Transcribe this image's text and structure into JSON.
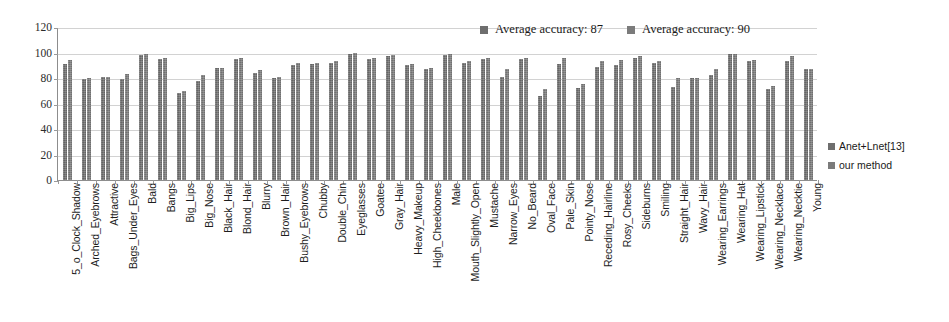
{
  "chart_data": {
    "type": "bar",
    "title": "",
    "xlabel": "",
    "ylabel": "",
    "ylim": [
      0,
      120
    ],
    "ytick_step": 20,
    "yticks": [
      120,
      100,
      80,
      60,
      40,
      20,
      0
    ],
    "grid": true,
    "legend_position": "top-center and right",
    "categories": [
      "5_o_Clock_Shadow",
      "Arched_Eyebrows",
      "Attractive",
      "Bags_Under_Eyes",
      "Bald",
      "Bangs",
      "Big_Lips",
      "Big_Nose",
      "Black_Hair",
      "Blond_Hair",
      "Blurry",
      "Brown_Hair",
      "Bushy_Eyebrows",
      "Chubby",
      "Double_Chin",
      "Eyeglasses",
      "Goatee",
      "Gray_Hair",
      "Heavy_Makeup",
      "High_Cheekbones",
      "Male",
      "Mouth_Slightly_Open",
      "Mustache",
      "Narrow_Eyes",
      "No_Beard",
      "Oval_Face",
      "Pale_Skin",
      "Pointy_Nose",
      "Receding_Hairline",
      "Rosy_Cheeks",
      "Sideburns",
      "Smiling",
      "Straight_Hair",
      "Wavy_Hair",
      "Wearing_Earrings",
      "Wearing_Hat",
      "Wearing_Lipstick",
      "Wearing_Necklace",
      "Wearing_Necktie",
      "Young"
    ],
    "series": [
      {
        "name": "Anet+Lnet[13]",
        "color": "#6e6e6e",
        "values": [
          91,
          79,
          81,
          79,
          98,
          95,
          68,
          78,
          88,
          95,
          84,
          80,
          90,
          91,
          92,
          99,
          95,
          97,
          90,
          87,
          98,
          92,
          95,
          81,
          95,
          66,
          91,
          72,
          89,
          90,
          96,
          92,
          73,
          80,
          82,
          99,
          93,
          71,
          93,
          87
        ]
      },
      {
        "name": "our method",
        "color": "#7b7b7b",
        "values": [
          94,
          80,
          81,
          83,
          99,
          96,
          70,
          82,
          88,
          96,
          86,
          81,
          92,
          92,
          93,
          100,
          96,
          98,
          91,
          88,
          99,
          93,
          96,
          87,
          96,
          71,
          96,
          75,
          93,
          94,
          97,
          93,
          80,
          80,
          87,
          99,
          94,
          74,
          97,
          87
        ]
      }
    ],
    "annotations": [
      {
        "text": "Average accuracy: 87",
        "series": "Anet+Lnet[13]"
      },
      {
        "text": "Average accuracy: 90",
        "series": "our method"
      }
    ]
  },
  "top_legend": {
    "entries": [
      {
        "label": "Average accuracy: 87"
      },
      {
        "label": "Average accuracy: 90"
      }
    ]
  },
  "series_legend": {
    "entries": [
      {
        "label": "Anet+Lnet[13]"
      },
      {
        "label": "our method"
      }
    ]
  }
}
